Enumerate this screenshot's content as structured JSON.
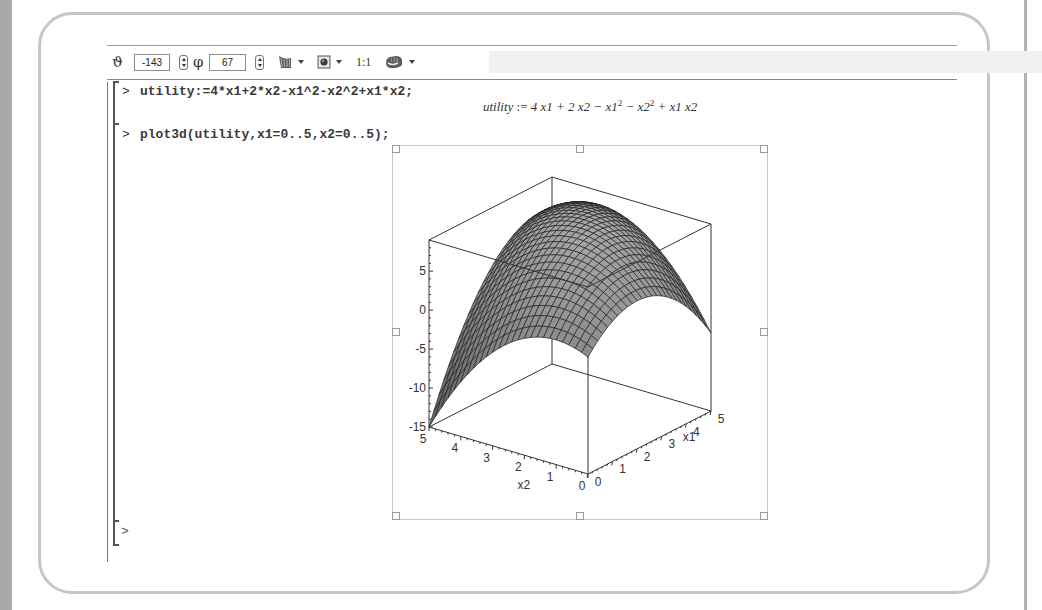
{
  "toolbar": {
    "theta_icon": "ϑ",
    "theta_value": "-143",
    "phi_icon": "φ",
    "phi_value": "67",
    "style_menu_icon": "surface-style-icon",
    "lighting_menu_icon": "lighting-icon",
    "scale_label": "1:1",
    "manipulator_menu_icon": "hand-rotate-icon"
  },
  "worksheet": {
    "prompt": ">",
    "commands": [
      {
        "input": "utility:=4*x1+2*x2-x1^2-x2^2+x1*x2;",
        "output": {
          "lhs": "utility",
          "assign": " := ",
          "parts": [
            "4 x1 + 2 x2 − x1",
            "2",
            " − x2",
            "2",
            " + x1 x2"
          ]
        }
      },
      {
        "input": "plot3d(utility,x1=0..5,x2=0..5);"
      }
    ],
    "empty_prompt": ">"
  },
  "chart_data": {
    "type": "surface3d",
    "function": "4*x1+2*x2-x1^2-x2^2+x1*x2",
    "x1_range": [
      0,
      5
    ],
    "x2_range": [
      0,
      5
    ],
    "view": {
      "theta": -143,
      "phi": 67
    },
    "axes": {
      "x1": {
        "label": "x1",
        "ticks": [
          "0",
          "1",
          "2",
          "3",
          "4",
          "5"
        ]
      },
      "x2": {
        "label": "x2",
        "ticks": [
          "5",
          "4",
          "3",
          "2",
          "1",
          "0"
        ]
      },
      "z": {
        "label": "",
        "ticks": [
          "5",
          "0",
          "-5",
          "-10",
          "-15"
        ],
        "range": [
          -15,
          9
        ]
      }
    },
    "z_max": 9.33,
    "z_min": -15,
    "grid": true,
    "surface_color": "#8a8a8a",
    "axes_style": "boxed"
  }
}
